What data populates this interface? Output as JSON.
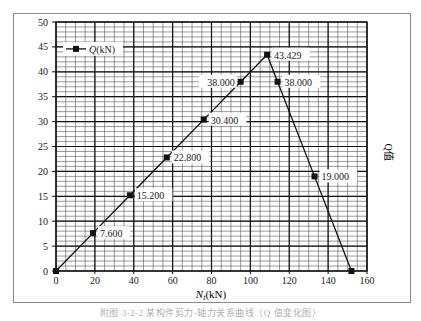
{
  "chart_data": {
    "type": "line",
    "title": "",
    "xlabel": "N_t(kN)",
    "ylabel": "Q值",
    "xlim": [
      0,
      160
    ],
    "ylim": [
      0,
      50
    ],
    "x_ticks": [
      0,
      20,
      40,
      60,
      80,
      100,
      120,
      140,
      160
    ],
    "y_ticks": [
      0,
      5,
      10,
      15,
      20,
      25,
      30,
      35,
      40,
      45,
      50
    ],
    "grid": true,
    "legend_position": "upper-left",
    "series": [
      {
        "name": "Q(kN)",
        "marker": "square",
        "x": [
          0,
          19,
          38,
          57,
          76,
          95,
          108.6,
          114,
          133,
          152
        ],
        "y": [
          0,
          7.6,
          15.2,
          22.8,
          30.4,
          38.0,
          43.429,
          38.0,
          19.0,
          0
        ],
        "labels": [
          "",
          "7.600",
          "15.200",
          "22.800",
          "30.400",
          "38.000",
          "43.429",
          "38.000",
          "19.000",
          ""
        ]
      }
    ]
  },
  "legend": {
    "label": "Q(kN)"
  },
  "axes": {
    "x_label": "N",
    "x_label_sub": "t",
    "x_label_unit": "(kN)",
    "y_label": "Q值"
  },
  "caption": "附图 3-2-2  某构件剪力-轴力关系曲线（Q 值变化图）"
}
